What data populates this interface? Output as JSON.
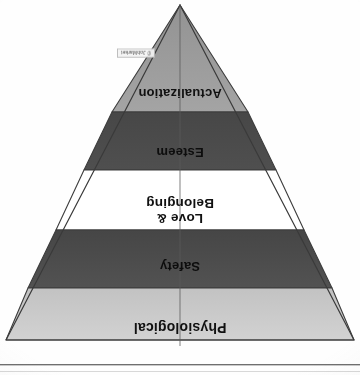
{
  "document": {
    "figure_title": "Maslow's Hierarchy of Needs",
    "orientation": "inverted-triangle-rotated-180",
    "background_color": "#ffffff"
  },
  "diagram": {
    "shape": "inverted-pyramid",
    "center_line_color": "#555555",
    "outline_color": "#3c3c3c",
    "tiers": [
      {
        "id": "physiological",
        "label": "Physiological",
        "fill": "#c9c9c9",
        "text_color": "#111111",
        "order": 1,
        "widest": true
      },
      {
        "id": "safety",
        "label": "Safety",
        "fill": "#4d4d4d",
        "text_color": "#0d0d0d",
        "order": 2
      },
      {
        "id": "love-belonging",
        "label": "Love &\nBelonging",
        "label_line_1": "Love &",
        "label_line_2": "Belonging",
        "fill": "#ffffff",
        "text_color": "#111111",
        "order": 3
      },
      {
        "id": "esteem",
        "label": "Esteem",
        "fill": "#4b4b4b",
        "text_color": "#0d0d0d",
        "order": 4
      },
      {
        "id": "actualization",
        "label": "Actualization",
        "fill": "#9c9c9c",
        "text_color": "#111111",
        "order": 5,
        "apex": true
      }
    ]
  },
  "watermark": {
    "text": "© JobMarket",
    "background": "#f4f4f4",
    "border_color": "#b9b9b9"
  },
  "rule": {
    "color": "#6f6f6f"
  }
}
